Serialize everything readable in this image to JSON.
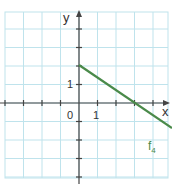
{
  "chart_data": {
    "type": "line",
    "title": "",
    "xlabel": "x",
    "ylabel": "y",
    "xlim": [
      -4,
      5
    ],
    "ylim": [
      -4.5,
      4.5
    ],
    "grid": true,
    "tick_labels": {
      "x": [
        "0",
        "1"
      ],
      "y": [
        "1"
      ]
    },
    "series": [
      {
        "name": "f4",
        "x": [
          0,
          3,
          5
        ],
        "y": [
          1.5,
          0,
          -1
        ],
        "color": "#4a8a4a",
        "equation": "f(x) = -0.5x + 1.5"
      }
    ],
    "annotations": [
      {
        "text": "f",
        "subscript": "4",
        "x": 4.5,
        "y": -1.6
      }
    ]
  },
  "labels": {
    "y_axis": "y",
    "x_axis": "x",
    "origin": "0",
    "x_one": "1",
    "y_one": "1",
    "func": "f",
    "func_sub": "4"
  },
  "colors": {
    "grid": "#bfe3ec",
    "axis": "#444444",
    "line": "#4a8a4a"
  }
}
